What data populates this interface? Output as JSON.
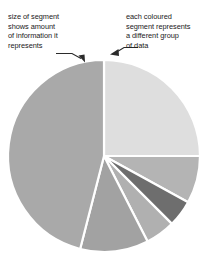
{
  "annotations": {
    "left": {
      "text": "size of segment\nshows amount\nof information it\nrepresents",
      "pointer_icon": "arrow-down-right-icon"
    },
    "right": {
      "text": "each coloured\nsegment represents\na different group\nof data",
      "pointer_icon": "arrow-left-down-icon"
    }
  },
  "colors": {
    "background": "#ffffff",
    "text": "#1a1a1a",
    "leader_line": "#2b2b2b",
    "segment_separator": "#ffffff",
    "seg_large_left": "#a9a9a9",
    "seg_top_right": "#dedede",
    "seg_right_mid": "#b4b4b4",
    "seg_dark": "#6e6e6e",
    "seg_small_light": "#b0b0b0",
    "seg_bottom_mid": "#a2a2a2"
  },
  "chart_data": {
    "type": "pie",
    "title": "",
    "xlabel": "",
    "ylabel": "",
    "legend": "none",
    "grid": false,
    "center": {
      "x": 104,
      "y": 156
    },
    "radius": 96,
    "start_angle_deg": -90,
    "direction": "clockwise",
    "categories": [
      "Group A",
      "Group B",
      "Group C",
      "Group D",
      "Group E",
      "Group F"
    ],
    "values": [
      25.0,
      8.0,
      4.5,
      5.0,
      11.5,
      46.0
    ],
    "slices": [
      {
        "name": "Group A",
        "start_deg": 0,
        "end_deg": 90,
        "percent": 25.0,
        "color": "#dedede"
      },
      {
        "name": "Group B",
        "start_deg": 90,
        "end_deg": 118.8,
        "percent": 8.0,
        "color": "#b4b4b4"
      },
      {
        "name": "Group C",
        "start_deg": 118.8,
        "end_deg": 135.0,
        "percent": 4.5,
        "color": "#6e6e6e"
      },
      {
        "name": "Group D",
        "start_deg": 135.0,
        "end_deg": 153.0,
        "percent": 5.0,
        "color": "#b0b0b0"
      },
      {
        "name": "Group E",
        "start_deg": 153.0,
        "end_deg": 194.4,
        "percent": 11.5,
        "color": "#a2a2a2"
      },
      {
        "name": "Group F",
        "start_deg": 194.4,
        "end_deg": 360.0,
        "percent": 46.0,
        "color": "#a9a9a9"
      }
    ]
  }
}
